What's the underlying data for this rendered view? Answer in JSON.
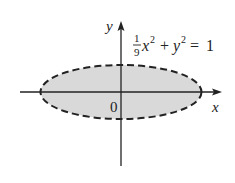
{
  "figure": {
    "type": "ellipse-region-plot",
    "axes": {
      "x_label": "x",
      "y_label": "y",
      "origin_label": "0"
    },
    "curve": {
      "equation_parts": {
        "frac_num": "1",
        "frac_den": "9",
        "x_var": "x",
        "x_exp": "2",
        "plus": "+",
        "y_var": "y",
        "y_exp": "2",
        "equals": "=",
        "rhs": "1"
      },
      "equation_text": "1/9 x^2 + y^2 = 1",
      "style": "dashed",
      "region": "interior shaded"
    },
    "colors": {
      "axis": "#222222",
      "curve": "#222222",
      "fill": "#d9d9d9",
      "background": "#ffffff"
    }
  }
}
